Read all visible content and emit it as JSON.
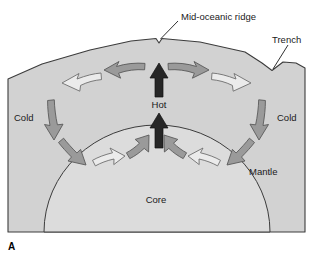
{
  "figure": {
    "panel_label": "A",
    "type": "mantle-convection-cross-section-diagram"
  },
  "labels": {
    "mid_oceanic_ridge": "Mid-oceanic ridge",
    "trench": "Trench",
    "cold_left": "Cold",
    "cold_right": "Cold",
    "hot": "Hot",
    "mantle": "Mantle",
    "core": "Core"
  },
  "colors": {
    "mantle_fill": "#d2d2d2",
    "core_fill": "#dcdcdc",
    "outline": "#3c3c3c",
    "arrow_gray_fill": "#9a9a9a",
    "arrow_gray_stroke": "#5a5a5a",
    "arrow_white_fill": "#ebebeb",
    "arrow_white_stroke": "#6e6e6e",
    "arrow_hot_fill": "#262626",
    "background": "#ffffff",
    "text": "#1a1a1a"
  },
  "arrows": {
    "hot_upwelling": [
      {
        "name": "hot-arrow-lower",
        "direction": "up",
        "style": "dark"
      },
      {
        "name": "hot-arrow-upper",
        "direction": "up",
        "style": "dark"
      }
    ],
    "convection_left": [
      {
        "name": "arrow-top-left-outward",
        "direction": "left",
        "style": "gray"
      },
      {
        "name": "arrow-upper-left-curve",
        "direction": "down-left-curve",
        "style": "white"
      },
      {
        "name": "arrow-left-descending",
        "direction": "down",
        "style": "gray"
      },
      {
        "name": "arrow-lower-left-diagonal",
        "direction": "down-right",
        "style": "gray"
      },
      {
        "name": "arrow-bottom-left-inward",
        "direction": "right-curve",
        "style": "white"
      },
      {
        "name": "arrow-bottom-left-to-center",
        "direction": "up-right",
        "style": "gray"
      }
    ],
    "convection_right": [
      {
        "name": "arrow-top-right-outward",
        "direction": "right",
        "style": "gray"
      },
      {
        "name": "arrow-upper-right-curve",
        "direction": "down-right-curve",
        "style": "white"
      },
      {
        "name": "arrow-right-descending",
        "direction": "down",
        "style": "gray"
      },
      {
        "name": "arrow-lower-right-diagonal",
        "direction": "down-left",
        "style": "gray"
      },
      {
        "name": "arrow-bottom-right-inward",
        "direction": "left-curve",
        "style": "white"
      },
      {
        "name": "arrow-bottom-right-to-center",
        "direction": "up-left",
        "style": "gray"
      }
    ]
  }
}
